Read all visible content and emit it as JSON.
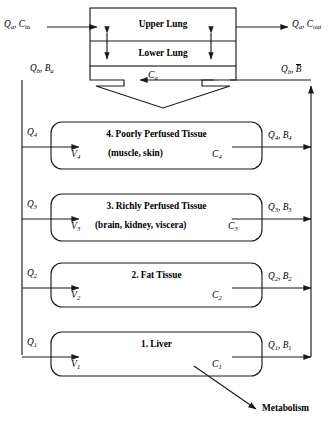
{
  "diagram": {
    "lung": {
      "upper_label": "Upper Lung",
      "lower_label": "Lower Lung",
      "arterial_mix_label": "Ca",
      "arterial_mix_base": "C",
      "arterial_mix_sub": "a"
    },
    "inlet": {
      "flow_base": "Q",
      "flow_sub": "a",
      "conc_base": "C",
      "conc_sub": "in",
      "text": "Qa, Cin"
    },
    "outlet": {
      "flow_base": "Q",
      "flow_sub": "a",
      "conc_base": "C",
      "conc_sub": "out",
      "text": "Qa, Cout"
    },
    "arterial_out": {
      "flow_base": "Q",
      "flow_sub": "b",
      "conc_base": "B",
      "conc_sub": "a",
      "text": "Qb, Ba"
    },
    "venous_in": {
      "flow_base": "Q",
      "flow_sub": "b",
      "conc_base": "B",
      "conc_overbar": true,
      "text": "Qb, B̄"
    },
    "metabolism_label": "Metabolism",
    "compartments": [
      {
        "index": "4",
        "title": "4. Poorly Perfused Tissue",
        "subtitle": "(muscle, skin)",
        "volume_base": "V",
        "volume_sub": "4",
        "conc_base": "C",
        "conc_sub": "4",
        "inflow_base": "Q",
        "inflow_sub": "4",
        "inflow_text": "Q4",
        "outflow_text": "Q4, B4",
        "outflow_flow_base": "Q",
        "outflow_flow_sub": "4",
        "outflow_conc_base": "B",
        "outflow_conc_sub": "4"
      },
      {
        "index": "3",
        "title": "3. Richly Perfused Tissue",
        "subtitle": "(brain, kidney, viscera)",
        "volume_base": "V",
        "volume_sub": "3",
        "conc_base": "C",
        "conc_sub": "3",
        "inflow_base": "Q",
        "inflow_sub": "3",
        "inflow_text": "Q3",
        "outflow_text": "Q3, B3",
        "outflow_flow_base": "Q",
        "outflow_flow_sub": "3",
        "outflow_conc_base": "B",
        "outflow_conc_sub": "3"
      },
      {
        "index": "2",
        "title": "2. Fat Tissue",
        "subtitle": "",
        "volume_base": "V",
        "volume_sub": "2",
        "conc_base": "C",
        "conc_sub": "2",
        "inflow_base": "Q",
        "inflow_sub": "2",
        "inflow_text": "Q2",
        "outflow_text": "Q2, B2",
        "outflow_flow_base": "Q",
        "outflow_flow_sub": "2",
        "outflow_conc_base": "B",
        "outflow_conc_sub": "2"
      },
      {
        "index": "1",
        "title": "1. Liver",
        "subtitle": "",
        "volume_base": "V",
        "volume_sub": "1",
        "conc_base": "C",
        "conc_sub": "1",
        "inflow_base": "Q",
        "inflow_sub": "1",
        "inflow_text": "Q1",
        "outflow_text": "Q1, B1",
        "outflow_flow_base": "Q",
        "outflow_flow_sub": "1",
        "outflow_conc_base": "B",
        "outflow_conc_sub": "1"
      }
    ],
    "colors": {
      "stroke": "#1a1a1a",
      "background": "#ffffff",
      "text": "#000000"
    }
  }
}
